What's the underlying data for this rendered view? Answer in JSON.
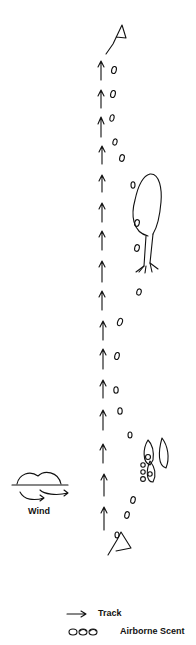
{
  "diagram": {
    "track_label_wind": "Wind",
    "legend": {
      "track": "Track",
      "scent": "Airborne Scent"
    },
    "elements": {
      "start_marker": "flag-start",
      "end_marker": "flag-end",
      "tree": "tree-icon",
      "bush": "bush-cluster",
      "cloud": "cloud-icon"
    },
    "colors": {
      "ink": "#111111",
      "background": "#ffffff"
    }
  }
}
